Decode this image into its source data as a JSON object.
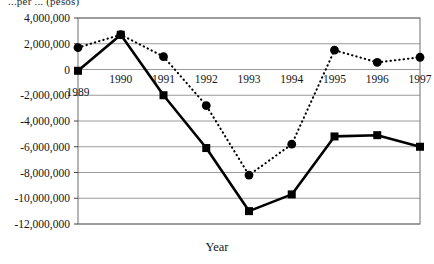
{
  "figure": {
    "clipped_top_label": "...per ... (pesos)",
    "xlabel": "Year",
    "ylabel": ""
  },
  "chart_data": {
    "type": "line",
    "title": "",
    "subtitle": "",
    "xlabel": "Year",
    "ylabel": "",
    "categories": [
      "1989",
      "1990",
      "1991",
      "1992",
      "1993",
      "1994",
      "1995",
      "1996",
      "1997"
    ],
    "x": [
      1989,
      1990,
      1991,
      1992,
      1993,
      1994,
      1995,
      1996,
      1997
    ],
    "ylim": [
      -12000000,
      4000000
    ],
    "yticks": [
      4000000,
      2000000,
      0,
      -2000000,
      -4000000,
      -6000000,
      -8000000,
      -10000000,
      -12000000
    ],
    "ytick_labels": [
      "4,000,000",
      "2,000,000",
      "0",
      "-2,000,000",
      "-4,000,000",
      "-6,000,000",
      "-8,000,000",
      "-10,000,000",
      "-12,000,000"
    ],
    "xtick_labels": [
      "1989",
      "1990",
      "1991",
      "1992",
      "1993",
      "1994",
      "1995",
      "1996",
      "1997"
    ],
    "grid": true,
    "grid_axis": "y",
    "legend": false,
    "legend_position": "none",
    "series": [
      {
        "name": "dotted-circle-series",
        "marker": "circle",
        "line_style": "dotted",
        "color": "#000000",
        "values": [
          1700000,
          2700000,
          1000000,
          -2800000,
          -8200000,
          -5800000,
          1500000,
          550000,
          950000
        ]
      },
      {
        "name": "solid-square-series",
        "marker": "square",
        "line_style": "solid",
        "color": "#000000",
        "values": [
          -100000,
          2700000,
          -2000000,
          -6100000,
          -11000000,
          -9700000,
          -5200000,
          -5100000,
          -6000000
        ]
      }
    ],
    "annotations": [
      {
        "text": "1989",
        "note": "x tick label offset below the zero gridline"
      }
    ]
  },
  "colors": {
    "line": "#000000",
    "grid": "#9a9a9a",
    "frame": "#6f6f6f",
    "background": "#ffffff"
  }
}
